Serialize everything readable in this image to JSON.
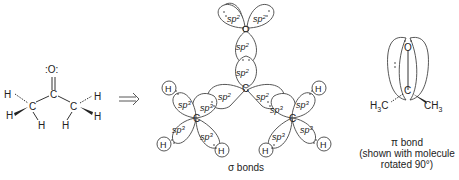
{
  "left_molecule": {
    "name": "acetone",
    "atoms": {
      "oxygen": ":O:",
      "carbonyl_carbon": "C",
      "methyl_carbon_left": "C",
      "methyl_carbon_right": "C",
      "hydrogen": "H"
    }
  },
  "arrow": {
    "glyph": "⟹"
  },
  "sigma_diagram": {
    "oxygen": "O",
    "carbon": "C",
    "hydrogen": "H",
    "sp2_base": "sp",
    "sp2_sup": "2",
    "sp3_base": "sp",
    "sp3_sup": "3",
    "caption": "σ bonds"
  },
  "pi_diagram": {
    "oxygen": "O",
    "carbon": "C",
    "left_group_main": "H",
    "left_group_sub": "3",
    "left_group_tail": "C",
    "right_group_main": "CH",
    "right_group_sub": "3",
    "caption_line1": "π bond",
    "caption_line2": "(shown with molecule",
    "caption_line3": "rotated 90°)"
  }
}
